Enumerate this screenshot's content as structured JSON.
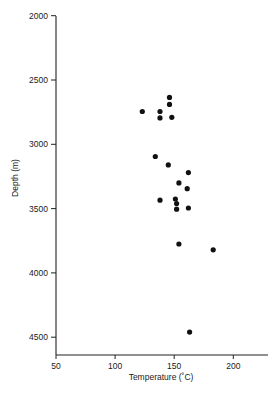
{
  "chart_data": {
    "type": "scatter",
    "title": "",
    "xlabel": "Temperature (˚C)",
    "ylabel": "Depth (m)",
    "xlim": [
      50,
      225
    ],
    "ylim": [
      4600,
      2000
    ],
    "y_inverted": true,
    "x_ticks": [
      50,
      100,
      150,
      200
    ],
    "y_ticks": [
      2000,
      2500,
      3000,
      3500,
      4000,
      4500
    ],
    "grid": false,
    "legend": null,
    "marker_color": "#111111",
    "series": [
      {
        "name": "Temperature vs Depth",
        "points": [
          {
            "x": 146,
            "y": 2635
          },
          {
            "x": 146,
            "y": 2690
          },
          {
            "x": 123,
            "y": 2745
          },
          {
            "x": 138,
            "y": 2745
          },
          {
            "x": 138,
            "y": 2795
          },
          {
            "x": 148,
            "y": 2790
          },
          {
            "x": 134,
            "y": 3095
          },
          {
            "x": 145,
            "y": 3160
          },
          {
            "x": 162,
            "y": 3220
          },
          {
            "x": 154,
            "y": 3300
          },
          {
            "x": 161,
            "y": 3345
          },
          {
            "x": 138,
            "y": 3435
          },
          {
            "x": 151,
            "y": 3425
          },
          {
            "x": 152,
            "y": 3460
          },
          {
            "x": 152,
            "y": 3505
          },
          {
            "x": 162,
            "y": 3495
          },
          {
            "x": 154,
            "y": 3775
          },
          {
            "x": 183,
            "y": 3820
          },
          {
            "x": 163,
            "y": 4460
          }
        ]
      }
    ]
  }
}
